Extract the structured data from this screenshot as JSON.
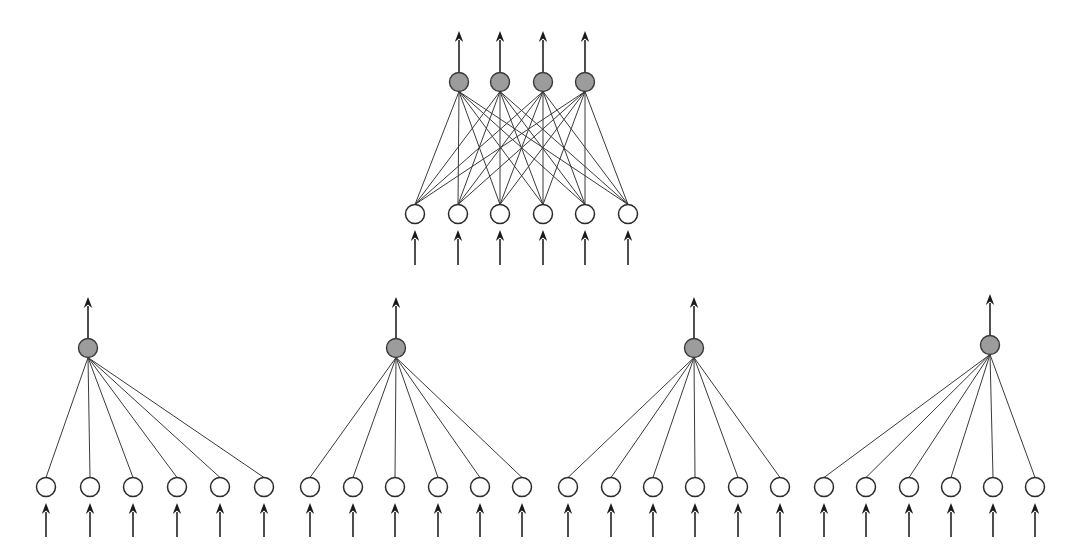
{
  "figure": {
    "background_color": "#ffffff",
    "width": 1083,
    "height": 560
  },
  "style": {
    "hidden_node_fill": "#ffffff",
    "hidden_node_stroke": "#2b2b2b",
    "output_node_fill": "#9c9c9c",
    "output_node_stroke": "#3a3a3a",
    "edge_color": "#3a3a3a",
    "arrow_color": "#1a1a1a",
    "hidden_node_radius": 9.5,
    "output_node_radius": 9.5,
    "edge_width": 1,
    "arrow_width": 1.6
  },
  "networks": [
    {
      "id": "top-network",
      "name": "fully-connected-network",
      "connectivity": "full",
      "output_row_y": 82,
      "input_row_y": 214,
      "output_nodes": [
        {
          "id": "t-out-1",
          "cx": 459,
          "cy": 82
        },
        {
          "id": "t-out-2",
          "cx": 500,
          "cy": 82
        },
        {
          "id": "t-out-3",
          "cx": 543,
          "cy": 82
        },
        {
          "id": "t-out-4",
          "cx": 585,
          "cy": 82
        }
      ],
      "input_nodes": [
        {
          "id": "t-in-1",
          "cx": 415,
          "cy": 214
        },
        {
          "id": "t-in-2",
          "cx": 458,
          "cy": 214
        },
        {
          "id": "t-in-3",
          "cx": 500,
          "cy": 214
        },
        {
          "id": "t-in-4",
          "cx": 543,
          "cy": 214
        },
        {
          "id": "t-in-5",
          "cx": 585,
          "cy": 214
        },
        {
          "id": "t-in-6",
          "cx": 628,
          "cy": 214
        }
      ],
      "output_arrows": [
        {
          "x": 459,
          "y_tail": 72,
          "y_head": 31
        },
        {
          "x": 500,
          "y_tail": 72,
          "y_head": 31
        },
        {
          "x": 543,
          "y_tail": 72,
          "y_head": 31
        },
        {
          "x": 585,
          "y_tail": 72,
          "y_head": 31
        }
      ],
      "input_arrows": [
        {
          "x": 415,
          "y_tail": 265,
          "y_head": 230
        },
        {
          "x": 458,
          "y_tail": 265,
          "y_head": 230
        },
        {
          "x": 500,
          "y_tail": 265,
          "y_head": 230
        },
        {
          "x": 543,
          "y_tail": 265,
          "y_head": 230
        },
        {
          "x": 585,
          "y_tail": 265,
          "y_head": 230
        },
        {
          "x": 628,
          "y_tail": 265,
          "y_head": 230
        }
      ]
    },
    {
      "id": "module-1",
      "name": "modular-subnetwork",
      "connectivity": "hub",
      "output_row_y": 348,
      "input_row_y": 487,
      "output_nodes": [
        {
          "id": "m1-out-1",
          "cx": 88,
          "cy": 348
        }
      ],
      "input_nodes": [
        {
          "id": "m1-in-1",
          "cx": 46,
          "cy": 487
        },
        {
          "id": "m1-in-2",
          "cx": 90,
          "cy": 487
        },
        {
          "id": "m1-in-3",
          "cx": 133,
          "cy": 487
        },
        {
          "id": "m1-in-4",
          "cx": 177,
          "cy": 487
        },
        {
          "id": "m1-in-5",
          "cx": 220,
          "cy": 487
        },
        {
          "id": "m1-in-6",
          "cx": 264,
          "cy": 487
        }
      ],
      "output_arrows": [
        {
          "x": 88,
          "y_tail": 338,
          "y_head": 297
        }
      ],
      "input_arrows": [
        {
          "x": 46,
          "y_tail": 537,
          "y_head": 503
        },
        {
          "x": 90,
          "y_tail": 537,
          "y_head": 503
        },
        {
          "x": 133,
          "y_tail": 537,
          "y_head": 503
        },
        {
          "x": 177,
          "y_tail": 537,
          "y_head": 503
        },
        {
          "x": 220,
          "y_tail": 537,
          "y_head": 503
        },
        {
          "x": 264,
          "y_tail": 537,
          "y_head": 503
        }
      ]
    },
    {
      "id": "module-2",
      "name": "modular-subnetwork",
      "connectivity": "hub",
      "output_row_y": 348,
      "input_row_y": 487,
      "output_nodes": [
        {
          "id": "m2-out-1",
          "cx": 396,
          "cy": 348
        }
      ],
      "input_nodes": [
        {
          "id": "m2-in-1",
          "cx": 310,
          "cy": 487
        },
        {
          "id": "m2-in-2",
          "cx": 353,
          "cy": 487
        },
        {
          "id": "m2-in-3",
          "cx": 395,
          "cy": 487
        },
        {
          "id": "m2-in-4",
          "cx": 438,
          "cy": 487
        },
        {
          "id": "m2-in-5",
          "cx": 480,
          "cy": 487
        },
        {
          "id": "m2-in-6",
          "cx": 522,
          "cy": 487
        }
      ],
      "output_arrows": [
        {
          "x": 396,
          "y_tail": 338,
          "y_head": 297
        }
      ],
      "input_arrows": [
        {
          "x": 310,
          "y_tail": 537,
          "y_head": 503
        },
        {
          "x": 353,
          "y_tail": 537,
          "y_head": 503
        },
        {
          "x": 395,
          "y_tail": 537,
          "y_head": 503
        },
        {
          "x": 438,
          "y_tail": 537,
          "y_head": 503
        },
        {
          "x": 480,
          "y_tail": 537,
          "y_head": 503
        },
        {
          "x": 522,
          "y_tail": 537,
          "y_head": 503
        }
      ]
    },
    {
      "id": "module-3",
      "name": "modular-subnetwork",
      "connectivity": "hub",
      "output_row_y": 348,
      "input_row_y": 487,
      "output_nodes": [
        {
          "id": "m3-out-1",
          "cx": 694,
          "cy": 348
        }
      ],
      "input_nodes": [
        {
          "id": "m3-in-1",
          "cx": 568,
          "cy": 487
        },
        {
          "id": "m3-in-2",
          "cx": 611,
          "cy": 487
        },
        {
          "id": "m3-in-3",
          "cx": 653,
          "cy": 487
        },
        {
          "id": "m3-in-4",
          "cx": 695,
          "cy": 487
        },
        {
          "id": "m3-in-5",
          "cx": 738,
          "cy": 487
        },
        {
          "id": "m3-in-6",
          "cx": 780,
          "cy": 487
        }
      ],
      "output_arrows": [
        {
          "x": 694,
          "y_tail": 338,
          "y_head": 297
        }
      ],
      "input_arrows": [
        {
          "x": 568,
          "y_tail": 537,
          "y_head": 503
        },
        {
          "x": 611,
          "y_tail": 537,
          "y_head": 503
        },
        {
          "x": 653,
          "y_tail": 537,
          "y_head": 503
        },
        {
          "x": 695,
          "y_tail": 537,
          "y_head": 503
        },
        {
          "x": 738,
          "y_tail": 537,
          "y_head": 503
        },
        {
          "x": 780,
          "y_tail": 537,
          "y_head": 503
        }
      ]
    },
    {
      "id": "module-4",
      "name": "modular-subnetwork",
      "connectivity": "hub",
      "output_row_y": 345,
      "input_row_y": 487,
      "output_nodes": [
        {
          "id": "m4-out-1",
          "cx": 990,
          "cy": 345
        }
      ],
      "input_nodes": [
        {
          "id": "m4-in-1",
          "cx": 824,
          "cy": 487
        },
        {
          "id": "m4-in-2",
          "cx": 866,
          "cy": 487
        },
        {
          "id": "m4-in-3",
          "cx": 909,
          "cy": 487
        },
        {
          "id": "m4-in-4",
          "cx": 951,
          "cy": 487
        },
        {
          "id": "m4-in-5",
          "cx": 993,
          "cy": 487
        },
        {
          "id": "m4-in-6",
          "cx": 1035,
          "cy": 487
        }
      ],
      "output_arrows": [
        {
          "x": 990,
          "y_tail": 335,
          "y_head": 294
        }
      ],
      "input_arrows": [
        {
          "x": 824,
          "y_tail": 537,
          "y_head": 503
        },
        {
          "x": 866,
          "y_tail": 537,
          "y_head": 503
        },
        {
          "x": 909,
          "y_tail": 537,
          "y_head": 503
        },
        {
          "x": 951,
          "y_tail": 537,
          "y_head": 503
        },
        {
          "x": 993,
          "y_tail": 537,
          "y_head": 503
        },
        {
          "x": 1035,
          "y_tail": 537,
          "y_head": 503
        }
      ]
    }
  ]
}
